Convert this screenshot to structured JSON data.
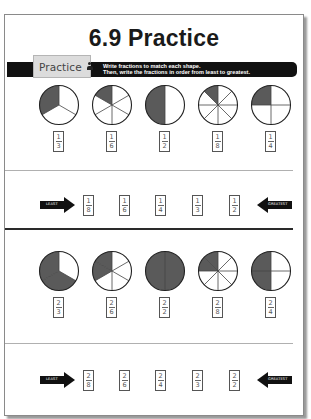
{
  "title": "6.9 Practice",
  "banner": {
    "tab_label": "Practice",
    "tab_icon": "person-icon",
    "instructions_line1": "Write fractions to match each shape.",
    "instructions_line2": "Then, write the fractions in order from least to greatest."
  },
  "colors": {
    "shaded": "#5a5a5a",
    "unshaded": "#ffffff",
    "banner": "#111111",
    "tab": "#dcdcdc"
  },
  "section1": {
    "shapes": [
      {
        "parts": 3,
        "shaded": 1,
        "fraction": {
          "num": "1",
          "den": "3"
        }
      },
      {
        "parts": 6,
        "shaded": 1,
        "fraction": {
          "num": "1",
          "den": "6"
        }
      },
      {
        "parts": 2,
        "shaded": 1,
        "fraction": {
          "num": "1",
          "den": "2"
        }
      },
      {
        "parts": 8,
        "shaded": 1,
        "fraction": {
          "num": "1",
          "den": "8"
        }
      },
      {
        "parts": 4,
        "shaded": 1,
        "fraction": {
          "num": "1",
          "den": "4"
        }
      }
    ],
    "order": {
      "least_label": "LEAST",
      "greatest_label": "GREATEST",
      "fractions": [
        {
          "num": "1",
          "den": "8"
        },
        {
          "num": "1",
          "den": "6"
        },
        {
          "num": "1",
          "den": "4"
        },
        {
          "num": "1",
          "den": "3"
        },
        {
          "num": "1",
          "den": "2"
        }
      ]
    }
  },
  "section2": {
    "shapes": [
      {
        "parts": 3,
        "shaded": 2,
        "fraction": {
          "num": "2",
          "den": "3"
        }
      },
      {
        "parts": 6,
        "shaded": 2,
        "fraction": {
          "num": "2",
          "den": "6"
        }
      },
      {
        "parts": 2,
        "shaded": 2,
        "fraction": {
          "num": "2",
          "den": "2"
        }
      },
      {
        "parts": 8,
        "shaded": 2,
        "fraction": {
          "num": "2",
          "den": "8"
        }
      },
      {
        "parts": 4,
        "shaded": 2,
        "fraction": {
          "num": "2",
          "den": "4"
        }
      }
    ],
    "order": {
      "least_label": "LEAST",
      "greatest_label": "GREATEST",
      "fractions": [
        {
          "num": "2",
          "den": "8"
        },
        {
          "num": "2",
          "den": "6"
        },
        {
          "num": "2",
          "den": "4"
        },
        {
          "num": "2",
          "den": "3"
        },
        {
          "num": "2",
          "den": "2"
        }
      ]
    }
  }
}
